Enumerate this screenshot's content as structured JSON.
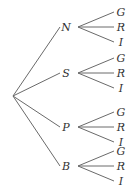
{
  "tree": {
    "root": "",
    "level1": [
      {
        "label": "N",
        "children": [
          "G",
          "R",
          "I"
        ]
      },
      {
        "label": "S",
        "children": [
          "G",
          "R",
          "I"
        ]
      },
      {
        "label": "P",
        "children": [
          "G",
          "R",
          "I"
        ]
      },
      {
        "label": "B",
        "children": [
          "G",
          "R",
          "I"
        ]
      }
    ]
  }
}
